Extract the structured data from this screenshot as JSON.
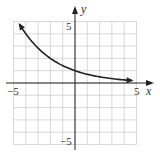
{
  "chart_data": {
    "type": "line",
    "title": "",
    "xlabel": "x",
    "ylabel": "y",
    "xlim": [
      -5,
      5
    ],
    "ylim": [
      -5,
      5
    ],
    "grid": true,
    "grid_step": 1,
    "x_tick_labels": [
      "-5",
      "5"
    ],
    "y_tick_labels": [
      "5",
      "-5"
    ],
    "series": [
      {
        "name": "f(x)",
        "description": "decreasing exponential with horizontal asymptote y = 0, y-intercept 1, arrowheads at both ends",
        "x": [
          -4.5,
          -4,
          -3,
          -2,
          -1,
          0,
          1,
          2,
          3,
          4,
          4.6
        ],
        "y": [
          4.76,
          4.0,
          2.83,
          2.0,
          1.41,
          1.0,
          0.71,
          0.5,
          0.35,
          0.25,
          0.2
        ]
      }
    ],
    "legend": null
  },
  "labels": {
    "x_axis": "x",
    "y_axis": "y",
    "x_min": "−5",
    "x_max": "5",
    "y_max": "5",
    "y_min": "−5"
  }
}
